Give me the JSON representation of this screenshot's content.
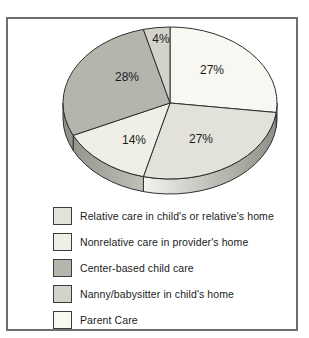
{
  "chart_data": {
    "type": "pie",
    "title": "",
    "unit": "%",
    "effect": "3d",
    "direction": "clockwise",
    "start_angle_deg": 0,
    "legend_position": "bottom-left",
    "slices": [
      {
        "label": "Parent Care",
        "value": 27,
        "color": "#f8f7f1",
        "label_pos": [
          212,
          74
        ]
      },
      {
        "label": "Relative care in child's or relative's home",
        "value": 27,
        "color": "#e3e2da",
        "label_pos": [
          201,
          143
        ]
      },
      {
        "label": "Nonrelative care in provider's home",
        "value": 14,
        "color": "#f0efe7",
        "label_pos": [
          134,
          144
        ]
      },
      {
        "label": "Center-based child care",
        "value": 28,
        "color": "#b5b5ae",
        "label_pos": [
          127,
          81
        ]
      },
      {
        "label": "Nanny/babysitter in child's home",
        "value": 4,
        "color": "#d3d3cb",
        "label_pos": [
          161,
          43
        ]
      }
    ],
    "legend_order": [
      1,
      2,
      3,
      4,
      0
    ],
    "colors": {
      "outline": "#2f2f2f",
      "rim_dark_right": "#8e8e87",
      "rim_light_right": "#f6f5ef",
      "rim_dark_left": "#8f8f88",
      "rim_light_left": "#c6c6be",
      "panel_border": "#6e6e6e"
    }
  }
}
